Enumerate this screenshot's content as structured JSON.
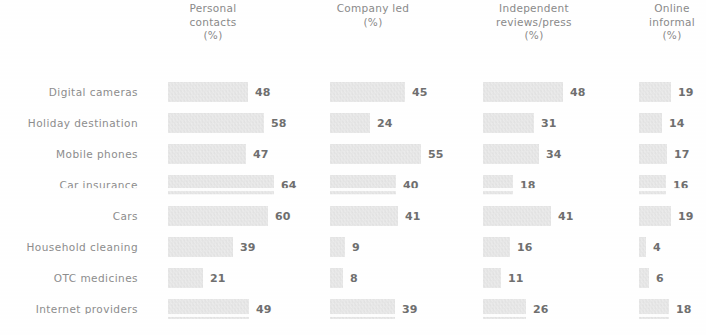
{
  "chart_data": {
    "type": "bar",
    "orientation": "horizontal",
    "title": "",
    "xlabel": "",
    "ylabel": "",
    "grid": false,
    "legend": "none",
    "value_suffix": "%",
    "categories": [
      "Digital cameras",
      "Holiday destination",
      "Mobile phones",
      "Car insurance",
      "Cars",
      "Household cleaning",
      "OTC medicines",
      "Internet providers"
    ],
    "series": [
      {
        "name": "Personal contacts (%)",
        "header_lines": [
          "Personal",
          "contacts",
          "(%)"
        ],
        "values": [
          48,
          58,
          47,
          64,
          60,
          39,
          21,
          49
        ]
      },
      {
        "name": "Company led (%)",
        "header_lines": [
          "Company led",
          "(%)"
        ],
        "values": [
          45,
          24,
          55,
          40,
          41,
          9,
          8,
          39
        ]
      },
      {
        "name": "Independent reviews/press (%)",
        "header_lines": [
          "Independent",
          "reviews/press",
          "(%)"
        ],
        "values": [
          48,
          31,
          34,
          18,
          41,
          16,
          11,
          26
        ]
      },
      {
        "name": "Online informal (%)",
        "header_lines": [
          "Online",
          "informal",
          "(%)"
        ],
        "values": [
          19,
          14,
          17,
          16,
          19,
          4,
          6,
          18
        ]
      }
    ],
    "xlim": [
      0,
      64
    ],
    "colors": {
      "bar": "#d9d9d9",
      "value_text": "#6f6f6f",
      "label_text": "#8d8d8d",
      "header_text": "#8a8a8a",
      "background": "#ffffff"
    }
  },
  "layout": {
    "columns": [
      {
        "bar_left": 168,
        "header_center": 213,
        "header_width": 130
      },
      {
        "bar_left": 330,
        "header_center": 373,
        "header_width": 130
      },
      {
        "bar_left": 483,
        "header_center": 534,
        "header_width": 150
      },
      {
        "bar_left": 639,
        "header_center": 672,
        "header_width": 110
      }
    ],
    "px_per_unit": 1.66,
    "row_height": 31,
    "rows_top": 78
  }
}
